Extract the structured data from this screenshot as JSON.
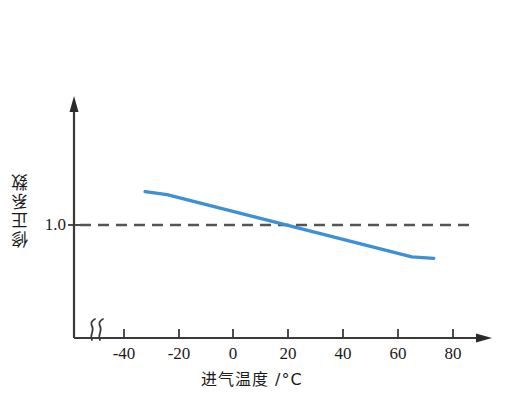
{
  "chart_data": {
    "type": "line",
    "title": "",
    "xlabel": "进气温度 /°C",
    "ylabel": "修正系数",
    "xlim": [
      -50,
      90
    ],
    "ylim": [
      0.55,
      1.45
    ],
    "grid": false,
    "legend_position": "none",
    "axis_break": true,
    "axis_break_symbol": "〜",
    "x_ticks": [
      -40,
      -20,
      0,
      20,
      40,
      60,
      80
    ],
    "x_tick_labels": [
      "-40",
      "-20",
      "0",
      "20",
      "40",
      "60",
      "80"
    ],
    "y_ticks": [
      1.0
    ],
    "y_tick_labels": [
      "1.0"
    ],
    "reference_line": {
      "value": 1.0,
      "style": "dashed",
      "color": "#555555",
      "label": "1.0"
    },
    "series": [
      {
        "name": "修正系数",
        "color": "#3d8fd6",
        "x": [
          -32,
          -24,
          65,
          73
        ],
        "values": [
          1.115,
          1.105,
          0.89,
          0.885
        ],
        "points": [
          {
            "x": -32,
            "y": 1.115
          },
          {
            "x": -24,
            "y": 1.105
          },
          {
            "x": 65,
            "y": 0.89
          },
          {
            "x": 73,
            "y": 0.885
          }
        ]
      }
    ],
    "annotations": []
  },
  "axes": {
    "x_axis_name": "x-axis",
    "y_axis_name": "y-axis",
    "arrowheads": true
  },
  "colors": {
    "series_blue": "#3d8fd6",
    "axis_black": "#1a1a1a",
    "reference_gray": "#555555",
    "background": "#ffffff"
  }
}
